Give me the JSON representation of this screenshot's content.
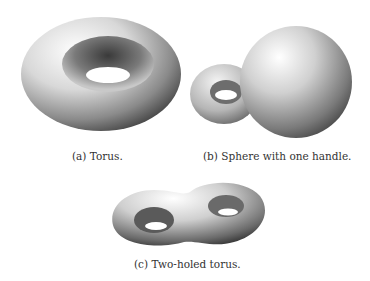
{
  "figure": {
    "subfigures": [
      {
        "id": "a",
        "label": "(a)",
        "caption": "Torus.",
        "full_caption": "(a) Torus."
      },
      {
        "id": "b",
        "label": "(b)",
        "caption": "Sphere with one handle.",
        "full_caption": "(b) Sphere with one handle."
      },
      {
        "id": "c",
        "label": "(c)",
        "caption": "Two-holed torus.",
        "full_caption": "(c) Two-holed torus."
      }
    ]
  }
}
